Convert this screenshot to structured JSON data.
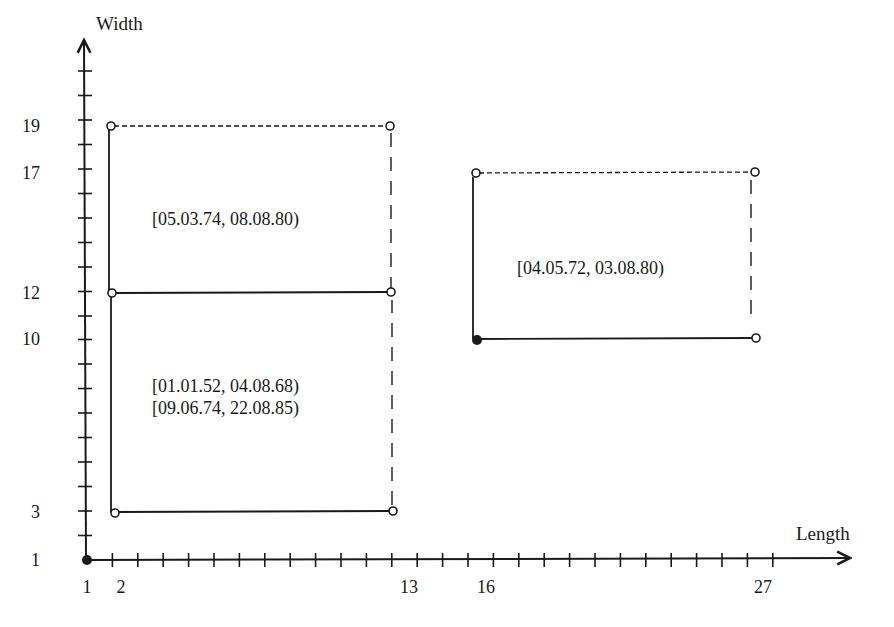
{
  "axes": {
    "x_label": "Length",
    "y_label": "Width",
    "x_tick_labels": [
      "1",
      "2",
      "13",
      "16",
      "27"
    ],
    "y_tick_labels": [
      "19",
      "17",
      "12",
      "10",
      "3",
      "1"
    ],
    "x_range": [
      1,
      30
    ],
    "y_range": [
      1,
      21
    ]
  },
  "regions": [
    {
      "id": "lower-left",
      "length": [
        2,
        13
      ],
      "width": [
        3,
        12
      ],
      "labels": [
        "[01.01.52, 04.08.68)",
        "[09.06.74, 22.08.85)"
      ]
    },
    {
      "id": "upper-left",
      "length": [
        2,
        13
      ],
      "width": [
        12,
        19
      ],
      "labels": [
        "[05.03.74, 08.08.80)"
      ]
    },
    {
      "id": "right",
      "length": [
        16,
        27
      ],
      "width": [
        10,
        17
      ],
      "labels": [
        "[04.05.72, 03.08.80)"
      ]
    }
  ],
  "colors": {
    "ink": "#1a1a1a",
    "background": "#ffffff"
  }
}
